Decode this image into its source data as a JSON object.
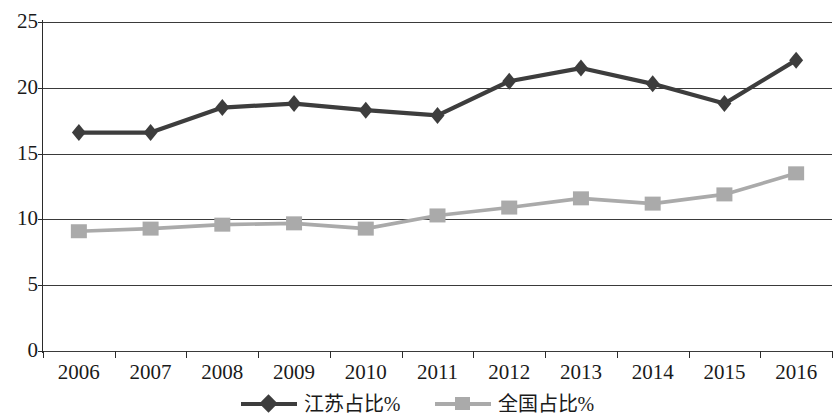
{
  "chart_data": {
    "type": "line",
    "title": "",
    "subtitle": "",
    "xlabel": "",
    "ylabel": "",
    "categories": [
      "2006",
      "2007",
      "2008",
      "2009",
      "2010",
      "2011",
      "2012",
      "2013",
      "2014",
      "2015",
      "2016"
    ],
    "series": [
      {
        "name": "江苏占比%",
        "color": "#3d3d3d",
        "marker": "diamond",
        "values": [
          16.6,
          16.6,
          18.5,
          18.8,
          18.3,
          17.9,
          20.5,
          21.5,
          20.3,
          18.8,
          22.1
        ]
      },
      {
        "name": "全国占比%",
        "color": "#aaaaaa",
        "marker": "square",
        "values": [
          9.1,
          9.3,
          9.6,
          9.7,
          9.3,
          10.3,
          10.9,
          11.6,
          11.2,
          11.9,
          13.5
        ]
      }
    ],
    "ylim": [
      0,
      25
    ],
    "y_ticks": [
      "0",
      "5",
      "10",
      "15",
      "20",
      "25"
    ],
    "y_tick_values": [
      0,
      5,
      10,
      15,
      20,
      25
    ],
    "grid": "horizontal",
    "legend_position": "bottom-center",
    "axis_color": "#2b2b2b",
    "gridline_color": "#3a3a3a",
    "background": "#ffffff"
  },
  "legend": {
    "entries": [
      {
        "label": "江苏占比%",
        "marker": "diamond-marker",
        "color": "#3d3d3d"
      },
      {
        "label": "全国占比%",
        "marker": "square-marker",
        "color": "#aaaaaa"
      }
    ]
  }
}
